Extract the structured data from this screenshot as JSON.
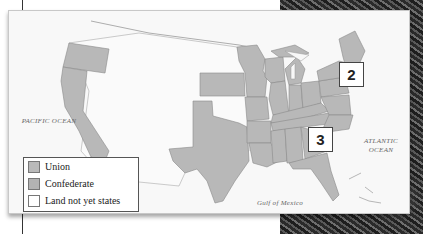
{
  "map": {
    "ocean_labels": {
      "pacific": "PACIFIC OCEAN",
      "atlantic": "ATLANTIC OCEAN",
      "gulf": "Gulf of Mexico"
    },
    "callouts": [
      {
        "label": "2"
      },
      {
        "label": "3"
      }
    ],
    "legend": {
      "items": [
        {
          "label": "Union",
          "color": "#b9b9b9"
        },
        {
          "label": "Confederate",
          "color": "#b3b3b3"
        },
        {
          "label": "Land not yet states",
          "color": "#ffffff"
        }
      ]
    },
    "colors": {
      "state_fill": "#b8b8b8",
      "state_border": "#8a8a8a",
      "territory_fill": "#fafafa",
      "water": "#f8f8f8"
    }
  }
}
